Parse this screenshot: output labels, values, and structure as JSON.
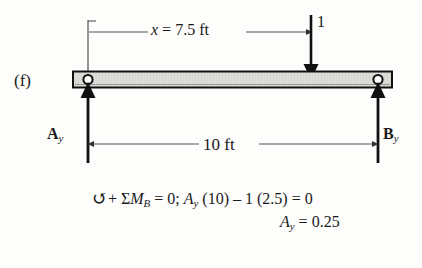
{
  "figure": {
    "index_label": "(f)",
    "type": "free-body-diagram"
  },
  "beam": {
    "span_label": "10 ft",
    "span_value": 10,
    "span_units": "ft"
  },
  "load": {
    "magnitude_label": "1",
    "magnitude": 1,
    "direction": "down",
    "position_label": "x = 7.5 ft",
    "position_prefix": "x",
    "position_equals": " = 7.5 ft",
    "position_value": 7.5
  },
  "supports": {
    "left": {
      "reaction_letter": "A",
      "reaction_subscript": "y",
      "type": "pin",
      "direction": "up"
    },
    "right": {
      "reaction_letter": "B",
      "reaction_subscript": "y",
      "type": "roller",
      "direction": "up"
    }
  },
  "equation": {
    "moment_symbol": "↺",
    "line1_a": "+ Σ",
    "line1_m": "M",
    "line1_m_sub": "B",
    "line1_b": " = 0; ",
    "line1_a_var": "A",
    "line1_a_sub": "y",
    "line1_c": " (10) – 1 (2.5) = 0",
    "line2_var": "A",
    "line2_sub": "y",
    "line2_rest": " = 0.25",
    "result_value": 0.25
  },
  "colors": {
    "ink": "#1a1a1a",
    "beam_fill": "#d8d8d4",
    "beam_stroke": "#111111",
    "thin_line": "#555555",
    "background": "#fdfdfc"
  }
}
